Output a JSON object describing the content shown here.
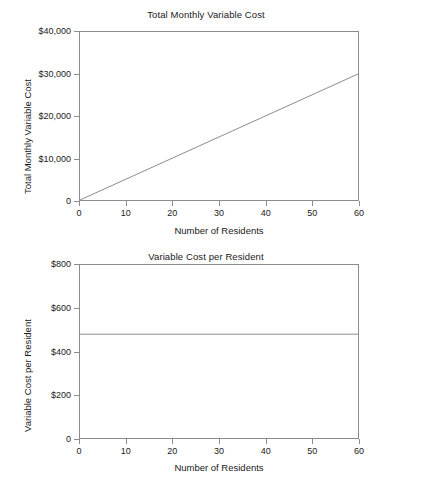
{
  "figure": {
    "background": "#ffffff",
    "line_color": "#8c8c8c",
    "text_color": "#1a1a1a",
    "width": 428,
    "height": 488
  },
  "chart_data": [
    {
      "type": "line",
      "title": "Total Monthly Variable Cost",
      "xlabel": "Number of Residents",
      "ylabel": "Total Monthly Variable Cost",
      "x": [
        0,
        60
      ],
      "values": [
        0,
        30000
      ],
      "xlim": [
        0,
        60
      ],
      "ylim": [
        0,
        40000
      ],
      "xticks": [
        0,
        10,
        20,
        30,
        40,
        50,
        60
      ],
      "xticklabels": [
        "0",
        "10",
        "20",
        "30",
        "40",
        "50",
        "60"
      ],
      "yticks": [
        0,
        10000,
        20000,
        30000,
        40000
      ],
      "yticklabels": [
        "0",
        "$10,000",
        "$20,000",
        "$30,000",
        "$40,000"
      ],
      "grid": false,
      "legend": "none",
      "series": [
        {
          "name": "Total monthly variable cost",
          "x": [
            0,
            60
          ],
          "values": [
            0,
            30000
          ]
        }
      ]
    },
    {
      "type": "line",
      "title": "Variable Cost per Resident",
      "xlabel": "Number of Residents",
      "ylabel": "Variable Cost per Resident",
      "x": [
        0,
        60
      ],
      "values": [
        480,
        480
      ],
      "xlim": [
        0,
        60
      ],
      "ylim": [
        0,
        800
      ],
      "xticks": [
        0,
        10,
        20,
        30,
        40,
        50,
        60
      ],
      "xticklabels": [
        "0",
        "10",
        "20",
        "30",
        "40",
        "50",
        "60"
      ],
      "yticks": [
        0,
        200,
        400,
        600,
        800
      ],
      "yticklabels": [
        "0",
        "$200",
        "$400",
        "$600",
        "$800"
      ],
      "grid": false,
      "legend": "none",
      "series": [
        {
          "name": "Variable cost per resident",
          "x": [
            0,
            60
          ],
          "values": [
            480,
            480
          ]
        }
      ]
    }
  ],
  "artifact": {
    "bottom_smudge": ""
  }
}
